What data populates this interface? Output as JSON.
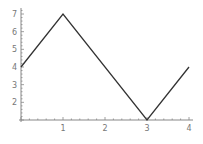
{
  "chart_data": {
    "type": "line",
    "title": "",
    "xlabel": "",
    "ylabel": "",
    "x": [
      0,
      1,
      3,
      4
    ],
    "series": [
      {
        "name": "series-1",
        "values": [
          4,
          7,
          1,
          4
        ],
        "color": "#333333"
      }
    ],
    "xticks": [
      1,
      2,
      3,
      4
    ],
    "yticks": [
      2,
      3,
      4,
      5,
      6,
      7
    ],
    "xlim": [
      0,
      4
    ],
    "ylim": [
      1,
      7
    ],
    "grid": false,
    "legend": "none",
    "axis_color": "#888888"
  }
}
